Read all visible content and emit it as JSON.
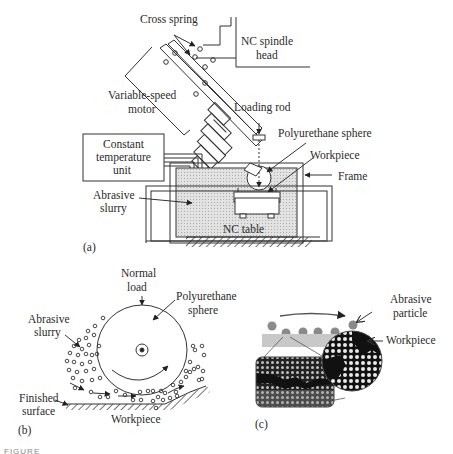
{
  "figure": {
    "caption_fragment": "FIGURE",
    "panels": [
      {
        "tag": "(a)",
        "labels": {
          "cross_spring": "Cross spring",
          "nc_spindle_head_1": "NC spindle",
          "nc_spindle_head_2": "head",
          "variable_speed_motor_1": "Variable-speed",
          "variable_speed_motor_2": "motor",
          "loading_rod": "Loading rod",
          "polyurethane_sphere": "Polyurethane sphere",
          "constant_temp_1": "Constant",
          "constant_temp_2": "temperature",
          "constant_temp_3": "unit",
          "workpiece": "Workpiece",
          "frame": "Frame",
          "abrasive_slurry_1": "Abrasive",
          "abrasive_slurry_2": "slurry",
          "nc_table": "NC table"
        }
      },
      {
        "tag": "(b)",
        "labels": {
          "normal_load_1": "Normal",
          "normal_load_2": "load",
          "polyurethane_sphere_1": "Polyurethane",
          "polyurethane_sphere_2": "sphere",
          "abrasive_slurry_1": "Abrasive",
          "abrasive_slurry_2": "slurry",
          "finished_surface_1": "Finished",
          "finished_surface_2": "surface",
          "workpiece": "Workpiece"
        }
      },
      {
        "tag": "(c)",
        "labels": {
          "abrasive_particle_1": "Abrasive",
          "abrasive_particle_2": "particle",
          "workpiece": "Workpiece"
        }
      }
    ],
    "colors": {
      "line": "#333333",
      "slurry_fill": "#dcdcdc",
      "workpiece_bar": "#c8c8c8",
      "particle": "#8a8a8a",
      "lattice_dark": "#1a1a1a"
    }
  }
}
